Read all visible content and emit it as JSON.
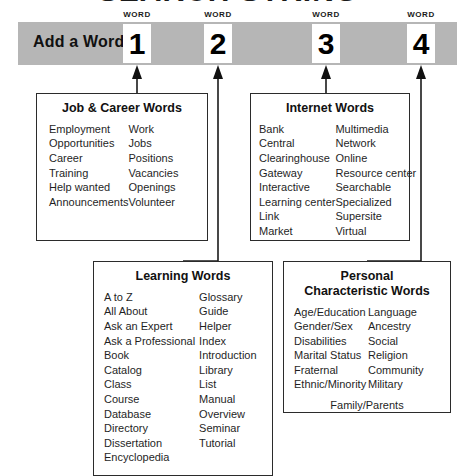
{
  "title": "SEARCH STRING",
  "header": {
    "add_label": "Add a Word",
    "slots": [
      {
        "label": "WORD",
        "number": "1"
      },
      {
        "label": "WORD",
        "number": "2"
      },
      {
        "label": "WORD",
        "number": "3"
      },
      {
        "label": "WORD",
        "number": "4"
      }
    ]
  },
  "colors": {
    "header_bar": "#b6b6b6",
    "box_border": "#2b2b2b",
    "text": "#1a1a1a",
    "background": "#ffffff"
  },
  "categories": [
    {
      "id": "job",
      "title": "Job & Career Words",
      "col1": [
        "Employment",
        "Opportunities",
        "Career",
        "Training",
        "Help wanted",
        "Announcements"
      ],
      "col2": [
        "Work",
        "Jobs",
        "Positions",
        "Vacancies",
        "Openings",
        "Volunteer"
      ],
      "footer": ""
    },
    {
      "id": "internet",
      "title": "Internet Words",
      "col1": [
        "Bank",
        "Central",
        "Clearinghouse",
        "Gateway",
        "Interactive",
        "Learning center",
        "Link",
        "Market"
      ],
      "col2": [
        "Multimedia",
        "Network",
        "Online",
        "Resource center",
        "Searchable",
        "Specialized",
        "Supersite",
        "Virtual"
      ],
      "footer": ""
    },
    {
      "id": "learning",
      "title": "Learning Words",
      "col1": [
        "A to Z",
        "All About",
        "Ask an Expert",
        "Ask a Professional",
        "Book",
        "Catalog",
        "Class",
        "Course",
        "Database",
        "Directory",
        "Dissertation",
        "Encyclopedia"
      ],
      "col2": [
        "Glossary",
        "Guide",
        "Helper",
        "Index",
        "Introduction",
        "Library",
        "List",
        "Manual",
        "Overview",
        "Seminar",
        "Tutorial"
      ],
      "footer": ""
    },
    {
      "id": "personal",
      "title": "Personal\nCharacteristic Words",
      "col1": [
        "Age/Education",
        "Gender/Sex",
        "Disabilities",
        "Marital Status",
        "Fraternal",
        "Ethnic/Minority"
      ],
      "col2": [
        "Language",
        "Ancestry",
        "Social",
        "Religion",
        "Community",
        "Military"
      ],
      "footer": "Family/Parents"
    }
  ]
}
